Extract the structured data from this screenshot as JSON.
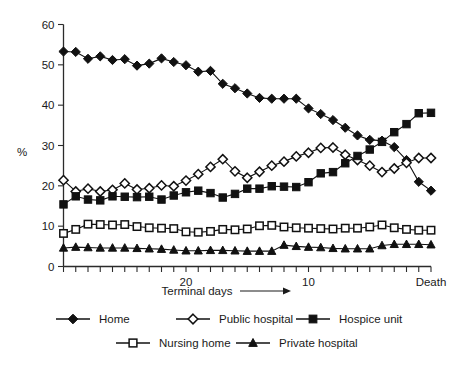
{
  "chart_data": {
    "type": "line",
    "title": "",
    "subtitle": "",
    "xlabel": "Terminal days",
    "ylabel": "%",
    "xlabel_arrow": "⟶",
    "xlim": [
      30,
      0
    ],
    "ylim": [
      0,
      60
    ],
    "grid": false,
    "legend_position": "bottom",
    "x_tick_labels": [
      "20",
      "10",
      "Death"
    ],
    "x_tick_values": [
      20,
      10,
      0
    ],
    "x_minor_tick_count": 31,
    "y_ticks": [
      0,
      10,
      20,
      30,
      40,
      50,
      60
    ],
    "y_tick_labels": [
      "0",
      "10",
      "20",
      "30",
      "40",
      "50",
      "60"
    ],
    "x": [
      30,
      29,
      28,
      27,
      26,
      25,
      24,
      23,
      22,
      21,
      20,
      19,
      18,
      17,
      16,
      15,
      14,
      13,
      12,
      11,
      10,
      9,
      8,
      7,
      6,
      5,
      4,
      3,
      2,
      1,
      0
    ],
    "series": [
      {
        "name": "Home",
        "marker": "filled-diamond",
        "values": [
          53.3,
          53.2,
          51.5,
          52.1,
          51.2,
          51.4,
          49.8,
          50.3,
          51.6,
          50.7,
          49.9,
          48.3,
          48.5,
          45.3,
          44.2,
          42.9,
          41.8,
          41.6,
          41.6,
          41.6,
          39.2,
          37.8,
          36.3,
          34.4,
          32.5,
          31.4,
          31.2,
          29.6,
          26.4,
          21.0,
          18.8
        ]
      },
      {
        "name": "Public hospital",
        "marker": "open-diamond",
        "values": [
          21.4,
          18.6,
          19.3,
          18.6,
          19.0,
          20.6,
          19.1,
          19.4,
          20.1,
          19.9,
          21.3,
          22.9,
          24.7,
          26.6,
          23.6,
          22.0,
          23.5,
          25.0,
          26.0,
          27.3,
          28.2,
          29.4,
          29.5,
          27.7,
          26.4,
          25.0,
          23.4,
          24.3,
          25.7,
          26.9,
          26.9
        ]
      },
      {
        "name": "Hospice unit",
        "marker": "filled-square",
        "values": [
          15.4,
          17.4,
          16.6,
          16.4,
          17.4,
          17.3,
          17.2,
          17.3,
          16.6,
          17.6,
          18.4,
          18.8,
          18.2,
          17.1,
          18.0,
          19.3,
          19.3,
          19.9,
          19.8,
          19.7,
          20.9,
          23.1,
          23.4,
          25.6,
          27.4,
          29.0,
          30.9,
          33.3,
          35.3,
          38.0,
          38.1
        ]
      },
      {
        "name": "Nursing home",
        "marker": "open-square",
        "values": [
          8.2,
          9.2,
          10.5,
          10.4,
          10.3,
          10.4,
          9.9,
          9.6,
          9.5,
          9.4,
          8.6,
          8.5,
          8.7,
          9.2,
          9.1,
          9.3,
          10.1,
          10.2,
          9.8,
          9.6,
          9.5,
          9.4,
          9.3,
          9.5,
          9.5,
          9.8,
          10.3,
          9.6,
          9.2,
          9.0,
          9.0
        ]
      },
      {
        "name": "Private hospital",
        "marker": "filled-triangle",
        "values": [
          4.6,
          4.8,
          4.7,
          4.6,
          4.6,
          4.6,
          4.5,
          4.4,
          4.3,
          4.1,
          3.9,
          3.9,
          4.0,
          4.0,
          3.9,
          3.8,
          3.8,
          3.8,
          5.3,
          5.0,
          4.8,
          4.7,
          4.5,
          4.4,
          4.4,
          4.4,
          5.2,
          5.5,
          5.5,
          5.5,
          5.4
        ]
      }
    ],
    "legend": [
      {
        "label": "Home",
        "marker": "filled-diamond"
      },
      {
        "label": "Public hospital",
        "marker": "open-diamond"
      },
      {
        "label": "Hospice unit",
        "marker": "filled-square"
      },
      {
        "label": "Nursing home",
        "marker": "open-square"
      },
      {
        "label": "Private hospital",
        "marker": "filled-triangle"
      }
    ]
  }
}
